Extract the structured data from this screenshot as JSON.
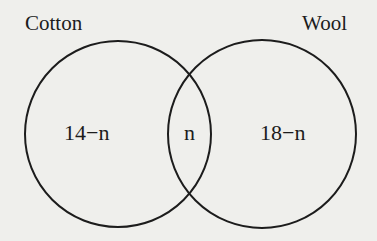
{
  "diagram": {
    "type": "venn",
    "colors": {
      "background": "#efefec",
      "stroke": "#1c1c1c"
    },
    "sets": [
      {
        "label": "Cotton",
        "cx": 118,
        "cy": 134,
        "r": 93
      },
      {
        "label": "Wool",
        "cx": 262,
        "cy": 134,
        "r": 94
      }
    ],
    "regions": {
      "cotton_only": "14−n",
      "intersection": "n",
      "wool_only": "18−n"
    }
  }
}
